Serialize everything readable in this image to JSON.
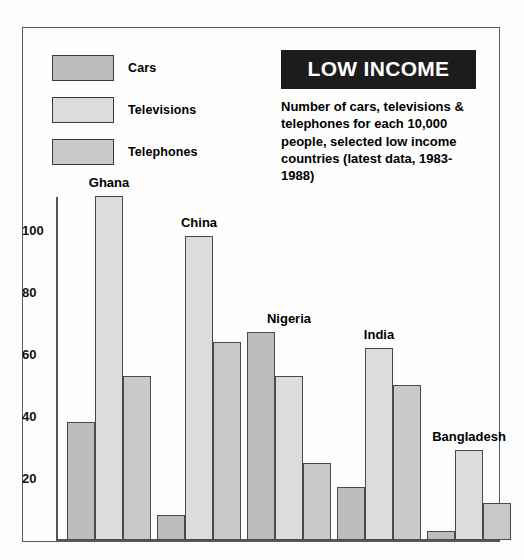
{
  "title": {
    "banner": "LOW INCOME",
    "subtitle": "Number of cars, televisions & telephones for each 10,000 people, selected low income countries (latest data, 1983-1988)"
  },
  "legend": {
    "position": "top-left",
    "items": [
      {
        "label": "Cars",
        "color": "#bdbdbd"
      },
      {
        "label": "Televisions",
        "color": "#dcdcdc"
      },
      {
        "label": "Telephones",
        "color": "#c9c9c9"
      }
    ]
  },
  "axis": {
    "y_ticks": [
      "100",
      "80",
      "60",
      "40",
      "20"
    ]
  },
  "colors": {
    "cars": "#bdbdbd",
    "televisions": "#dcdcdc",
    "telephones": "#c9c9c9",
    "banner_bg": "#1c1c1c",
    "banner_fg": "#ffffff",
    "bar_outline": "#4a4a4a",
    "frame": "#5a5a5a"
  },
  "chart_data": {
    "type": "bar",
    "title": "LOW INCOME",
    "subtitle": "Number of cars, televisions & telephones for each 10,000 people, selected low income countries (latest data, 1983-1988)",
    "xlabel": "",
    "ylabel": "",
    "ylim": [
      0,
      115
    ],
    "yticks": [
      20,
      40,
      60,
      80,
      100
    ],
    "grid": false,
    "legend": [
      "Cars",
      "Televisions",
      "Telephones"
    ],
    "legend_position": "top-left",
    "categories": [
      "Ghana",
      "China",
      "Nigeria",
      "India",
      "Bangladesh"
    ],
    "series": [
      {
        "name": "Cars",
        "values": [
          38,
          8,
          67,
          17,
          3
        ]
      },
      {
        "name": "Televisions",
        "values": [
          111,
          98,
          53,
          62,
          29
        ]
      },
      {
        "name": "Telephones",
        "values": [
          53,
          64,
          25,
          50,
          12
        ]
      }
    ]
  },
  "groups": [
    {
      "label": "Ghana",
      "label_x": 106,
      "label_y": 165
    },
    {
      "label": "China",
      "label_x": 196,
      "label_y": 207
    },
    {
      "label": "Nigeria",
      "label_x": 286,
      "label_y": 298
    },
    {
      "label": "India",
      "label_x": 376,
      "label_y": 314
    },
    {
      "label": "Bangladesh",
      "label_x": 466,
      "label_y": 413
    }
  ]
}
